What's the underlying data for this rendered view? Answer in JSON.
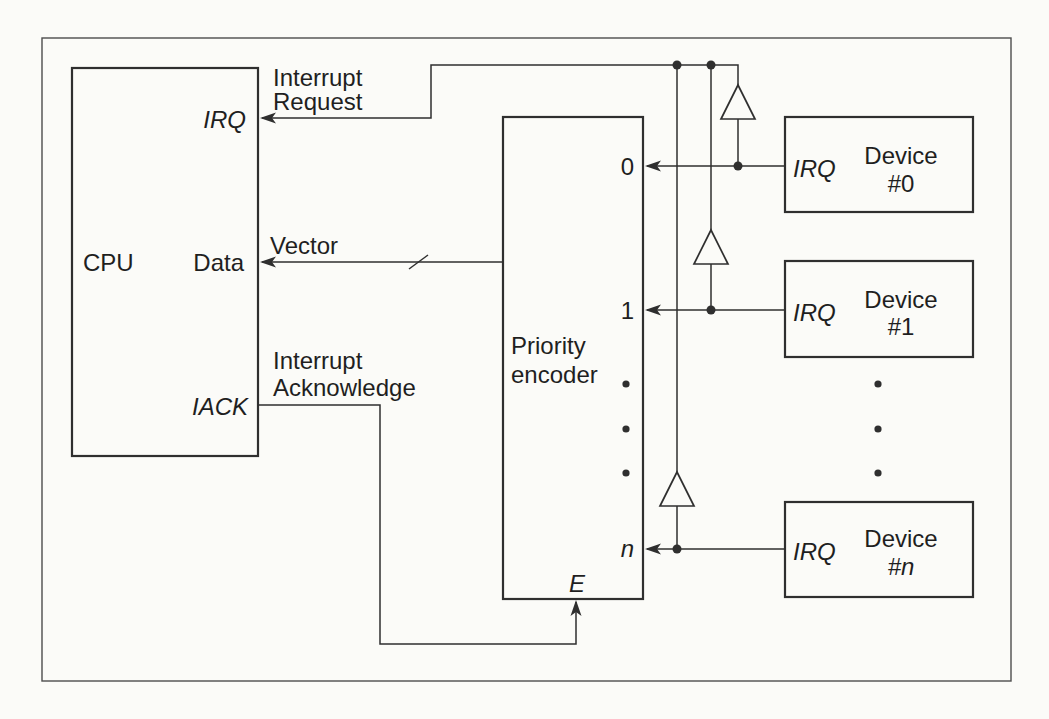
{
  "figure": {
    "cpu": {
      "name": "CPU",
      "port_irq": "IRQ",
      "port_data": "Data",
      "port_iack": "IACK"
    },
    "encoder": {
      "title_line1": "Priority",
      "title_line2": "encoder",
      "input_0": "0",
      "input_1": "1",
      "input_n": "n",
      "enable": "E"
    },
    "signals": {
      "irq_line1": "Interrupt",
      "irq_line2": "Request",
      "vector": "Vector",
      "iack_line1": "Interrupt",
      "iack_line2": "Acknowledge"
    },
    "devices": [
      {
        "port": "IRQ",
        "name": "Device",
        "id": "#0"
      },
      {
        "port": "IRQ",
        "name": "Device",
        "id": "#1"
      },
      {
        "port": "IRQ",
        "name": "Device",
        "id": "#n"
      }
    ],
    "colors": {
      "line": "#2f2f2f",
      "text": "#1f1f1f",
      "background": "#fbfbf8",
      "border": "#4d4d4d"
    }
  }
}
